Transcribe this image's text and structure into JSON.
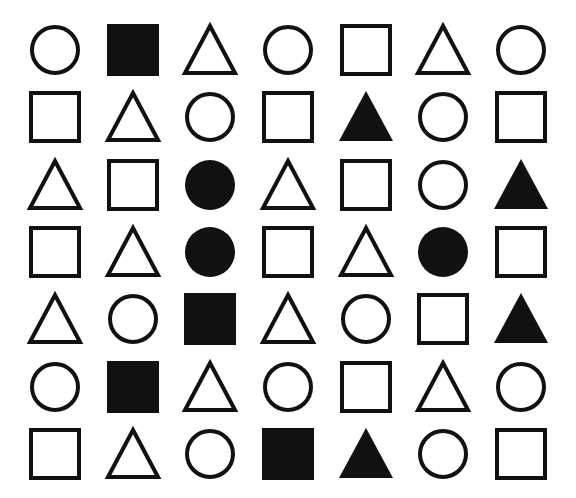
{
  "page": {
    "background_color": "#ffffff",
    "shape_color": "#111111",
    "width": 576,
    "height": 498,
    "rows": 7,
    "columns": 7
  },
  "legend": {
    "shape_names": [
      "circle",
      "square",
      "triangle"
    ],
    "fill_styles": [
      "outline",
      "filled"
    ]
  },
  "grid": {
    "rows": [
      {
        "index": 1,
        "cells": [
          {
            "shape": "circle",
            "fill": "outline",
            "name": "circle-outline"
          },
          {
            "shape": "square",
            "fill": "filled",
            "name": "square-filled"
          },
          {
            "shape": "triangle",
            "fill": "outline",
            "name": "triangle-outline"
          },
          {
            "shape": "circle",
            "fill": "outline",
            "name": "circle-outline"
          },
          {
            "shape": "square",
            "fill": "outline",
            "name": "square-outline"
          },
          {
            "shape": "triangle",
            "fill": "outline",
            "name": "triangle-outline"
          },
          {
            "shape": "circle",
            "fill": "outline",
            "name": "circle-outline"
          }
        ]
      },
      {
        "index": 2,
        "cells": [
          {
            "shape": "square",
            "fill": "outline",
            "name": "square-outline"
          },
          {
            "shape": "triangle",
            "fill": "outline",
            "name": "triangle-outline"
          },
          {
            "shape": "circle",
            "fill": "outline",
            "name": "circle-outline"
          },
          {
            "shape": "square",
            "fill": "outline",
            "name": "square-outline"
          },
          {
            "shape": "triangle",
            "fill": "filled",
            "name": "triangle-filled"
          },
          {
            "shape": "circle",
            "fill": "outline",
            "name": "circle-outline"
          },
          {
            "shape": "square",
            "fill": "outline",
            "name": "square-outline"
          }
        ]
      },
      {
        "index": 3,
        "cells": [
          {
            "shape": "triangle",
            "fill": "outline",
            "name": "triangle-outline"
          },
          {
            "shape": "square",
            "fill": "outline",
            "name": "square-outline"
          },
          {
            "shape": "circle",
            "fill": "filled",
            "name": "circle-filled"
          },
          {
            "shape": "triangle",
            "fill": "outline",
            "name": "triangle-outline"
          },
          {
            "shape": "square",
            "fill": "outline",
            "name": "square-outline"
          },
          {
            "shape": "circle",
            "fill": "outline",
            "name": "circle-outline"
          },
          {
            "shape": "triangle",
            "fill": "filled",
            "name": "triangle-filled"
          }
        ]
      },
      {
        "index": 4,
        "cells": [
          {
            "shape": "square",
            "fill": "outline",
            "name": "square-outline"
          },
          {
            "shape": "triangle",
            "fill": "outline",
            "name": "triangle-outline"
          },
          {
            "shape": "circle",
            "fill": "filled",
            "name": "circle-filled"
          },
          {
            "shape": "square",
            "fill": "outline",
            "name": "square-outline"
          },
          {
            "shape": "triangle",
            "fill": "outline",
            "name": "triangle-outline"
          },
          {
            "shape": "circle",
            "fill": "filled",
            "name": "circle-filled"
          },
          {
            "shape": "square",
            "fill": "outline",
            "name": "square-outline"
          }
        ]
      },
      {
        "index": 5,
        "cells": [
          {
            "shape": "triangle",
            "fill": "outline",
            "name": "triangle-outline"
          },
          {
            "shape": "circle",
            "fill": "outline",
            "name": "circle-outline"
          },
          {
            "shape": "square",
            "fill": "filled",
            "name": "square-filled"
          },
          {
            "shape": "triangle",
            "fill": "outline",
            "name": "triangle-outline"
          },
          {
            "shape": "circle",
            "fill": "outline",
            "name": "circle-outline"
          },
          {
            "shape": "square",
            "fill": "outline",
            "name": "square-outline"
          },
          {
            "shape": "triangle",
            "fill": "filled",
            "name": "triangle-filled"
          }
        ]
      },
      {
        "index": 6,
        "cells": [
          {
            "shape": "circle",
            "fill": "outline",
            "name": "circle-outline"
          },
          {
            "shape": "square",
            "fill": "filled",
            "name": "square-filled"
          },
          {
            "shape": "triangle",
            "fill": "outline",
            "name": "triangle-outline"
          },
          {
            "shape": "circle",
            "fill": "outline",
            "name": "circle-outline"
          },
          {
            "shape": "square",
            "fill": "outline",
            "name": "square-outline"
          },
          {
            "shape": "triangle",
            "fill": "outline",
            "name": "triangle-outline"
          },
          {
            "shape": "circle",
            "fill": "outline",
            "name": "circle-outline"
          }
        ]
      },
      {
        "index": 7,
        "cells": [
          {
            "shape": "square",
            "fill": "outline",
            "name": "square-outline"
          },
          {
            "shape": "triangle",
            "fill": "outline",
            "name": "triangle-outline"
          },
          {
            "shape": "circle",
            "fill": "outline",
            "name": "circle-outline"
          },
          {
            "shape": "square",
            "fill": "filled",
            "name": "square-filled"
          },
          {
            "shape": "triangle",
            "fill": "filled",
            "name": "triangle-filled"
          },
          {
            "shape": "circle",
            "fill": "outline",
            "name": "circle-outline"
          },
          {
            "shape": "square",
            "fill": "outline",
            "name": "square-outline"
          }
        ]
      }
    ]
  },
  "counts": {
    "total_shapes": 49,
    "circles": 17,
    "squares": 17,
    "triangles": 15,
    "filled": 10,
    "outline": 39
  }
}
